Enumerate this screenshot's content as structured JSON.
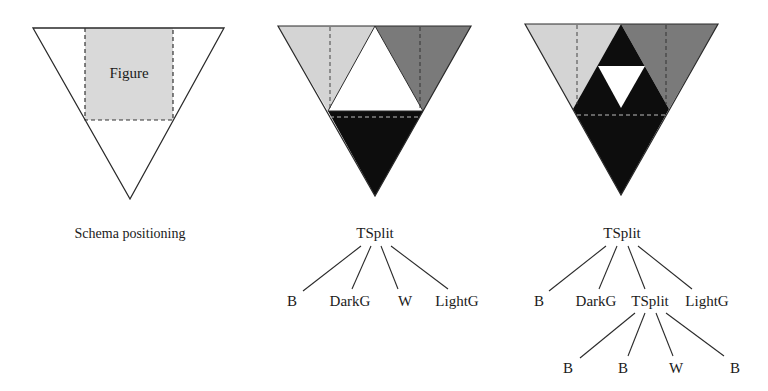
{
  "colors": {
    "light_gray": "#d4d4d4",
    "dark_gray": "#7a7a7a",
    "black": "#0d0d0d",
    "white": "#ffffff",
    "stroke": "#2a2a2a"
  },
  "panel1": {
    "figure_label": "Figure",
    "caption": "Schema positioning"
  },
  "panel2": {
    "root": "TSplit",
    "children": [
      "B",
      "DarkG",
      "W",
      "LightG"
    ]
  },
  "panel3": {
    "root": "TSplit",
    "children": [
      "B",
      "DarkG",
      "TSplit",
      "LightG"
    ],
    "grandchildren": [
      "B",
      "B",
      "W",
      "B"
    ]
  }
}
